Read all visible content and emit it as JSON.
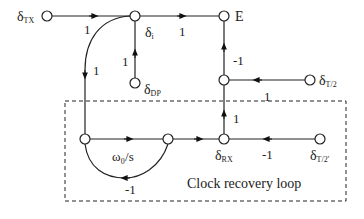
{
  "diagram": {
    "type": "signal-flow-graph",
    "nodes": {
      "tx": {
        "label": "δ",
        "sub": "TX"
      },
      "i": {
        "label": "δ",
        "sub": "i"
      },
      "e": {
        "label": "E"
      },
      "dp": {
        "label": "δ",
        "sub": "DP"
      },
      "t2": {
        "label": "δ",
        "sub": "T/2"
      },
      "rx": {
        "label": "δ",
        "sub": "RX"
      },
      "t2p": {
        "label": "δ",
        "sub": "T/2'"
      }
    },
    "gains": {
      "tx_to_i": "1",
      "i_to_e": "1",
      "dp_to_i": "1",
      "i_to_loop": "1",
      "mid_to_e": "-1",
      "t2_to_mid": "1",
      "rx_to_mid": "1",
      "integrator": "ω₀/s",
      "feedback": "-1",
      "t2p_to_rx": "-1"
    },
    "box_label": "Clock recovery loop"
  }
}
